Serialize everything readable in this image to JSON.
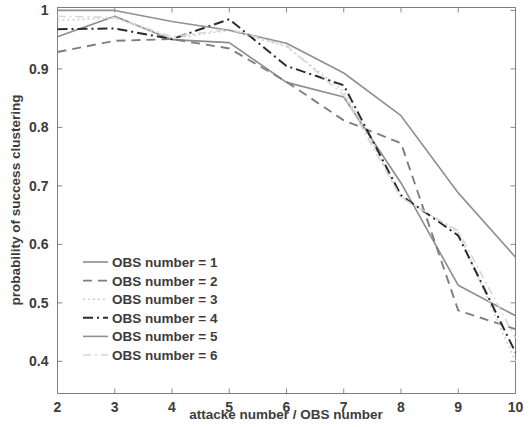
{
  "chart_data": {
    "type": "line",
    "title": "",
    "subtitle": "",
    "xlabel": "attacke number / OBS number",
    "ylabel": "probability of success clustering",
    "x": [
      2,
      3,
      4,
      5,
      6,
      7,
      8,
      9,
      10
    ],
    "xlim": [
      2,
      10
    ],
    "ylim": [
      0.345,
      1.005
    ],
    "xticks": [
      2,
      3,
      4,
      5,
      6,
      7,
      8,
      9,
      10
    ],
    "xtick_labels": [
      "2",
      "3",
      "4",
      "5",
      "6",
      "7",
      "8",
      "9",
      "10"
    ],
    "yticks": [
      0.4,
      0.5,
      0.6,
      0.7,
      0.8,
      0.9,
      1.0
    ],
    "ytick_labels": [
      "0.4",
      "0.5",
      "0.6",
      "0.7",
      "0.8",
      "0.9",
      "1"
    ],
    "grid": false,
    "legend_position": "lower left",
    "series": [
      {
        "name": "OBS number = 1",
        "style": "solid",
        "color": "#8c8c8c",
        "width": 1.6,
        "dash": "",
        "values": [
          0.955,
          0.99,
          0.95,
          0.945,
          0.877,
          0.852,
          0.705,
          0.53,
          0.478
        ]
      },
      {
        "name": "OBS number = 2",
        "style": "dashed",
        "color": "#7e7e7e",
        "width": 1.9,
        "dash": "9 6",
        "values": [
          0.929,
          0.948,
          0.951,
          0.935,
          0.878,
          0.812,
          0.773,
          0.487,
          0.455
        ]
      },
      {
        "name": "OBS number = 3",
        "style": "dotted",
        "color": "#cfcfcf",
        "width": 1.6,
        "dash": "2 3",
        "values": [
          0.983,
          0.987,
          0.952,
          0.966,
          0.938,
          0.862,
          0.682,
          0.62,
          0.4
        ]
      },
      {
        "name": "OBS number = 4",
        "style": "dash-dot",
        "color": "#2b2b2b",
        "width": 2.0,
        "dash": "10 4 2 4",
        "values": [
          0.968,
          0.969,
          0.951,
          0.985,
          0.905,
          0.872,
          0.684,
          0.615,
          0.415
        ]
      },
      {
        "name": "OBS number = 5",
        "style": "solid",
        "color": "#909090",
        "width": 1.6,
        "dash": "",
        "values": [
          1.0,
          1.0,
          0.981,
          0.966,
          0.944,
          0.893,
          0.82,
          0.688,
          0.578
        ]
      },
      {
        "name": "OBS number = 6",
        "style": "dash-dot",
        "color": "#d6d6d6",
        "width": 1.6,
        "dash": "8 4 2 4",
        "values": [
          0.99,
          0.988,
          0.955,
          0.968,
          0.94,
          0.855,
          0.68,
          0.623,
          0.44
        ]
      }
    ]
  },
  "axes": {
    "x_title": "attacke number / OBS number",
    "y_title": "probability of success clustering"
  },
  "legend": {
    "items": [
      {
        "label": "OBS number = 1"
      },
      {
        "label": "OBS number = 2"
      },
      {
        "label": "OBS number = 3"
      },
      {
        "label": "OBS number = 4"
      },
      {
        "label": "OBS number = 5"
      },
      {
        "label": "OBS number = 6"
      }
    ]
  },
  "colors": {
    "axis": "#7d7d7d",
    "text": "#3c3c3c",
    "background": "#ffffff"
  }
}
